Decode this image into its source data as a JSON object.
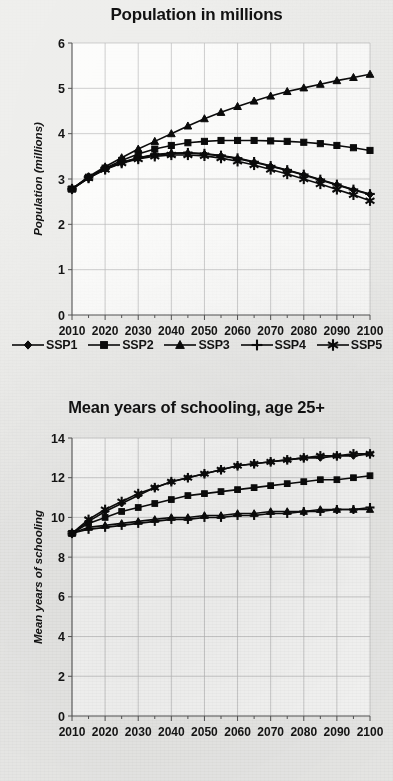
{
  "figures": [
    {
      "id": "population",
      "title": "Population in millions",
      "ylabel": "Population (millions)",
      "has_legend": true
    },
    {
      "id": "schooling",
      "title": "Mean years of schooling, age 25+",
      "ylabel": "Mean years of schooling",
      "has_legend": false
    }
  ],
  "legend": {
    "items": [
      {
        "label": "SSP1",
        "marker": "diamond-marker"
      },
      {
        "label": "SSP2",
        "marker": "square-marker"
      },
      {
        "label": "SSP3",
        "marker": "triangle-marker"
      },
      {
        "label": "SSP4",
        "marker": "plus-marker"
      },
      {
        "label": "SSP5",
        "marker": "asterisk-marker"
      }
    ]
  },
  "chart_data": [
    {
      "type": "line",
      "title": "Population in millions",
      "xlabel": "",
      "ylabel": "Population (millions)",
      "xlim": [
        2010,
        2100
      ],
      "ylim": [
        0,
        6
      ],
      "yticks": [
        0,
        1,
        2,
        3,
        4,
        5,
        6
      ],
      "xticks": [
        2010,
        2020,
        2030,
        2040,
        2050,
        2060,
        2070,
        2080,
        2090,
        2100
      ],
      "x": [
        2010,
        2015,
        2020,
        2025,
        2030,
        2035,
        2040,
        2045,
        2050,
        2055,
        2060,
        2065,
        2070,
        2075,
        2080,
        2085,
        2090,
        2095,
        2100
      ],
      "grid": true,
      "legend_position": "bottom",
      "series": [
        {
          "name": "SSP1",
          "marker": "diamond",
          "values": [
            2.78,
            3.02,
            3.22,
            3.36,
            3.46,
            3.53,
            3.56,
            3.57,
            3.55,
            3.51,
            3.45,
            3.37,
            3.28,
            3.19,
            3.09,
            2.98,
            2.87,
            2.76,
            2.66
          ]
        },
        {
          "name": "SSP2",
          "marker": "square",
          "values": [
            2.78,
            3.04,
            3.24,
            3.41,
            3.55,
            3.66,
            3.74,
            3.8,
            3.83,
            3.85,
            3.85,
            3.85,
            3.84,
            3.83,
            3.81,
            3.78,
            3.74,
            3.69,
            3.63
          ]
        },
        {
          "name": "SSP3",
          "marker": "triangle",
          "values": [
            2.78,
            3.05,
            3.27,
            3.47,
            3.66,
            3.83,
            4.0,
            4.17,
            4.33,
            4.47,
            4.6,
            4.72,
            4.83,
            4.93,
            5.01,
            5.09,
            5.17,
            5.24,
            5.31
          ]
        },
        {
          "name": "SSP4",
          "marker": "plus",
          "values": [
            2.78,
            3.03,
            3.23,
            3.37,
            3.47,
            3.54,
            3.57,
            3.58,
            3.56,
            3.52,
            3.46,
            3.38,
            3.29,
            3.2,
            3.1,
            2.99,
            2.88,
            2.77,
            2.67
          ]
        },
        {
          "name": "SSP5",
          "marker": "asterisk",
          "values": [
            2.78,
            3.02,
            3.21,
            3.35,
            3.44,
            3.5,
            3.53,
            3.53,
            3.51,
            3.46,
            3.39,
            3.31,
            3.21,
            3.11,
            3.0,
            2.89,
            2.77,
            2.65,
            2.52
          ]
        }
      ]
    },
    {
      "type": "line",
      "title": "Mean years of schooling, age 25+",
      "xlabel": "",
      "ylabel": "Mean years of schooling",
      "xlim": [
        2010,
        2100
      ],
      "ylim": [
        0,
        14
      ],
      "yticks": [
        0,
        2,
        4,
        6,
        8,
        10,
        12,
        14
      ],
      "xticks": [
        2010,
        2020,
        2030,
        2040,
        2050,
        2060,
        2070,
        2080,
        2090,
        2100
      ],
      "x": [
        2010,
        2015,
        2020,
        2025,
        2030,
        2035,
        2040,
        2045,
        2050,
        2055,
        2060,
        2065,
        2070,
        2075,
        2080,
        2085,
        2090,
        2095,
        2100
      ],
      "grid": true,
      "legend_position": "none",
      "series": [
        {
          "name": "SSP1",
          "marker": "diamond",
          "values": [
            9.2,
            9.8,
            10.3,
            10.7,
            11.1,
            11.5,
            11.8,
            12.0,
            12.2,
            12.4,
            12.6,
            12.7,
            12.8,
            12.9,
            13.0,
            13.0,
            13.1,
            13.1,
            13.2
          ]
        },
        {
          "name": "SSP2",
          "marker": "square",
          "values": [
            9.2,
            9.7,
            10.0,
            10.3,
            10.5,
            10.7,
            10.9,
            11.1,
            11.2,
            11.3,
            11.4,
            11.5,
            11.6,
            11.7,
            11.8,
            11.9,
            11.9,
            12.0,
            12.1
          ]
        },
        {
          "name": "SSP3",
          "marker": "triangle",
          "values": [
            9.2,
            9.5,
            9.6,
            9.7,
            9.8,
            9.9,
            10.0,
            10.0,
            10.1,
            10.1,
            10.2,
            10.2,
            10.3,
            10.3,
            10.3,
            10.4,
            10.4,
            10.4,
            10.4
          ]
        },
        {
          "name": "SSP4",
          "marker": "plus",
          "values": [
            9.2,
            9.4,
            9.5,
            9.6,
            9.7,
            9.8,
            9.9,
            9.9,
            10.0,
            10.0,
            10.1,
            10.1,
            10.2,
            10.2,
            10.3,
            10.3,
            10.4,
            10.4,
            10.5
          ]
        },
        {
          "name": "SSP5",
          "marker": "asterisk",
          "values": [
            9.2,
            9.9,
            10.4,
            10.8,
            11.2,
            11.5,
            11.8,
            12.0,
            12.2,
            12.4,
            12.6,
            12.7,
            12.8,
            12.9,
            13.0,
            13.1,
            13.1,
            13.2,
            13.2
          ]
        }
      ]
    }
  ]
}
